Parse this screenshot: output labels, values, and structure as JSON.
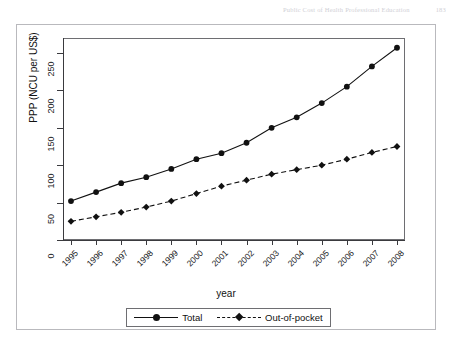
{
  "page_header": {
    "title": "Public Cost of Health Professional Education",
    "page_number": "183"
  },
  "chart_data": {
    "type": "line",
    "title": "",
    "xlabel": "year",
    "ylabel": "PPP (NCU per US$)",
    "categories": [
      "1995",
      "1996",
      "1997",
      "1998",
      "1999",
      "2000",
      "2001",
      "2002",
      "2003",
      "2004",
      "2005",
      "2006",
      "2007",
      "2008"
    ],
    "x_tick_labels": [
      "1995",
      "1996",
      "1997",
      "1998",
      "1999",
      "2000",
      "2001",
      "2002",
      "2003",
      "2004",
      "2005",
      "2006",
      "2007",
      "2008"
    ],
    "y_tick_labels": [
      "0",
      "50",
      "100",
      "150",
      "200",
      "250"
    ],
    "y_ticks": [
      0,
      50,
      100,
      150,
      200,
      250
    ],
    "ylim": [
      0,
      270
    ],
    "grid": false,
    "legend_position": "bottom",
    "series": [
      {
        "name": "Total",
        "line_style": "solid",
        "marker": "circle",
        "color": "#111111",
        "values": [
          52,
          64,
          76,
          84,
          95,
          108,
          116,
          130,
          150,
          164,
          183,
          205,
          232,
          257
        ]
      },
      {
        "name": "Out-of-pocket",
        "line_style": "dashed",
        "marker": "diamond",
        "color": "#111111",
        "values": [
          25,
          31,
          37,
          44,
          52,
          62,
          72,
          80,
          88,
          94,
          100,
          108,
          117,
          125
        ]
      }
    ]
  },
  "legend": {
    "entries": [
      {
        "label": "Total"
      },
      {
        "label": "Out-of-pocket"
      }
    ]
  },
  "colors": {
    "ink": "#111111",
    "frame": "#6e6e72",
    "paper": "#ffffff",
    "scan_border": "#b9b9bd"
  }
}
